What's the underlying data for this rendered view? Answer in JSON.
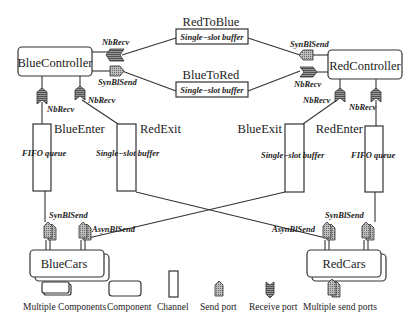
{
  "components": {
    "blue_controller": "BlueController",
    "red_controller": "RedController",
    "blue_cars": "BlueCars",
    "red_cars": "RedCars"
  },
  "channels": {
    "red_to_blue": {
      "name": "RedToBlue",
      "type": "Single−slot buffer"
    },
    "blue_to_red": {
      "name": "BlueToRed",
      "type": "Single−slot buffer"
    },
    "blue_enter": {
      "name": "BlueEnter",
      "type": "FIFO queue"
    },
    "red_exit": {
      "name": "RedExit",
      "type": "Single−slot buffer"
    },
    "blue_exit": {
      "name": "BlueExit",
      "type": "Single−slot buffer"
    },
    "red_enter": {
      "name": "RedEnter",
      "type": "FIFO queue"
    }
  },
  "ports": {
    "bc_nbrecv_top": "NbRecv",
    "bc_synblsend": "SynBlSend",
    "bc_nbrecv_left": "NbRecv",
    "bc_nbrecv_right": "NbRecv",
    "rc_synblsend": "SynBlSend",
    "rc_nbrecv": "NbRecv",
    "rc_nbrecv_left": "NbRecv",
    "rc_nbrecv_right": "NbRecv",
    "bcars_synblsend": "SynBlSend",
    "bcars_asynblsend": "AsynBlSend",
    "rcars_asynblsend": "AsynBlSend",
    "rcars_synblsend": "SynBlSend"
  },
  "legend": {
    "multiple_components": "Multiple Components",
    "component": "Component",
    "channel": "Channel",
    "send_port": "Send port",
    "receive_port": "Receive port",
    "multiple_send_ports": "Multiple send ports"
  }
}
